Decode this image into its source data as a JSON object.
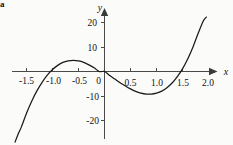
{
  "figure": {
    "label": "a",
    "background_color": "#fbfbfa",
    "curve_color": "#1a1a1a",
    "axis_color": "#4a4a4a"
  },
  "chart_data": {
    "type": "line",
    "title": "",
    "subtitle": "",
    "xlabel": "x",
    "ylabel": "y",
    "xlim": [
      -1.75,
      2.15
    ],
    "ylim": [
      -27,
      24
    ],
    "grid": false,
    "legend": null,
    "xticks": [
      -1.5,
      -1.0,
      -0.5,
      0,
      0.5,
      1.0,
      1.5,
      2.0
    ],
    "xticklabels": [
      "-1.5",
      "-1.0",
      "-0.5",
      "0",
      "0.5",
      "1.0",
      "1.5",
      "2.0"
    ],
    "yticks": [
      20,
      10,
      -10,
      -20
    ],
    "yticklabels": [
      "20",
      "10",
      "-10",
      "-20"
    ],
    "annotations": [],
    "series": [
      {
        "name": "cubic",
        "x": [
          -1.72,
          -1.65,
          -1.6,
          -1.5,
          -1.4,
          -1.3,
          -1.2,
          -1.1,
          -1.0,
          -0.9,
          -0.8,
          -0.7,
          -0.6,
          -0.5,
          -0.4,
          -0.3,
          -0.2,
          -0.1,
          0.0,
          0.1,
          0.2,
          0.3,
          0.4,
          0.5,
          0.6,
          0.7,
          0.8,
          0.9,
          1.0,
          1.1,
          1.2,
          1.3,
          1.4,
          1.5,
          1.6,
          1.7,
          1.8,
          1.9,
          1.96
        ],
        "y": [
          -28.8,
          -25.0,
          -22.7,
          -17.0,
          -12.1,
          -7.9,
          -4.4,
          -1.5,
          0.8,
          2.5,
          3.7,
          4.3,
          4.5,
          4.3,
          3.7,
          2.7,
          1.5,
          0.0,
          0.0,
          -1.6,
          -3.1,
          -4.6,
          -5.9,
          -7.1,
          -8.1,
          -8.8,
          -9.2,
          -9.2,
          -8.8,
          -8.0,
          -6.6,
          -4.7,
          -2.1,
          1.1,
          5.1,
          9.9,
          15.5,
          20.6,
          22.2
        ]
      }
    ]
  }
}
